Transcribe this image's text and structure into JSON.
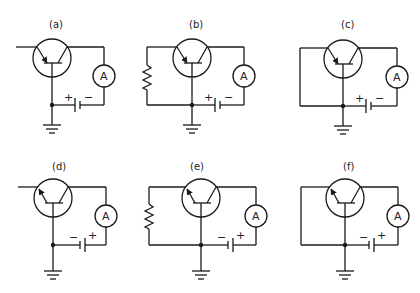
{
  "figure": {
    "panels": [
      {
        "id": "a",
        "label": "(a)",
        "base_connection": "open-lead",
        "arrow": "in",
        "battery_left_sign": "+",
        "battery_right_sign": "−",
        "meter": "A"
      },
      {
        "id": "b",
        "label": "(b)",
        "base_connection": "resistor",
        "arrow": "in",
        "battery_left_sign": "+",
        "battery_right_sign": "−",
        "meter": "A"
      },
      {
        "id": "c",
        "label": "(c)",
        "base_connection": "short",
        "arrow": "in",
        "battery_left_sign": "+",
        "battery_right_sign": "−",
        "meter": "A"
      },
      {
        "id": "d",
        "label": "(d)",
        "base_connection": "open-lead",
        "arrow": "out",
        "battery_left_sign": "−",
        "battery_right_sign": "+",
        "meter": "A"
      },
      {
        "id": "e",
        "label": "(e)",
        "base_connection": "resistor",
        "arrow": "out",
        "battery_left_sign": "−",
        "battery_right_sign": "+",
        "meter": "A"
      },
      {
        "id": "f",
        "label": "(f)",
        "base_connection": "short",
        "arrow": "out",
        "battery_left_sign": "−",
        "battery_right_sign": "+",
        "meter": "A"
      }
    ]
  }
}
